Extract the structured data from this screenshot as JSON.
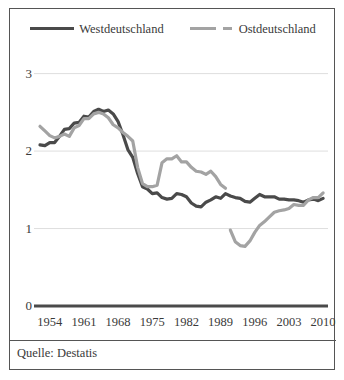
{
  "figure": {
    "source_note": "Quelle: Destatis",
    "border_color": "#555555",
    "background": "#ffffff"
  },
  "legend": {
    "position": "top-center",
    "entries": [
      {
        "label": "Westdeutschland",
        "color": "#4a4a4a",
        "style": "solid",
        "marker": "line-swatch-solid"
      },
      {
        "label": "Ostdeutschland",
        "color": "#a3a3a3",
        "style": "dashed",
        "marker": "line-swatch-dashed"
      }
    ]
  },
  "chart_data": {
    "type": "line",
    "title": "",
    "subtitle": "",
    "xlabel": "",
    "ylabel": "",
    "xlim": [
      1952,
      2011
    ],
    "ylim": [
      0,
      3.15
    ],
    "grid": true,
    "grid_axis": "y",
    "legend_position": "top-center",
    "xticks": [
      1954,
      1961,
      1968,
      1975,
      1982,
      1989,
      1996,
      2003,
      2010
    ],
    "yticks": [
      0,
      1,
      2,
      3
    ],
    "ytick_labels": [
      "0",
      "1",
      "2",
      "3"
    ],
    "xtick_labels": [
      "1954",
      "1961",
      "1968",
      "1975",
      "1982",
      "1989",
      "1996",
      "2003",
      "2010"
    ],
    "series": [
      {
        "name": "Westdeutschland",
        "color": "#4a4a4a",
        "style": "solid",
        "x": [
          1952,
          1953,
          1954,
          1955,
          1956,
          1957,
          1958,
          1959,
          1960,
          1961,
          1962,
          1963,
          1964,
          1965,
          1966,
          1967,
          1968,
          1969,
          1970,
          1971,
          1972,
          1973,
          1974,
          1975,
          1976,
          1977,
          1978,
          1979,
          1980,
          1981,
          1982,
          1983,
          1984,
          1985,
          1986,
          1987,
          1988,
          1989,
          1990,
          1991,
          1992,
          1993,
          1994,
          1995,
          1996,
          1997,
          1998,
          1999,
          2000,
          2001,
          2002,
          2003,
          2004,
          2005,
          2006,
          2007,
          2008,
          2009,
          2010
        ],
        "values": [
          2.08,
          2.07,
          2.11,
          2.11,
          2.19,
          2.28,
          2.29,
          2.36,
          2.37,
          2.45,
          2.44,
          2.51,
          2.54,
          2.51,
          2.53,
          2.48,
          2.38,
          2.21,
          2.02,
          1.92,
          1.71,
          1.54,
          1.51,
          1.45,
          1.46,
          1.4,
          1.38,
          1.39,
          1.45,
          1.44,
          1.41,
          1.33,
          1.29,
          1.28,
          1.34,
          1.37,
          1.41,
          1.39,
          1.45,
          1.42,
          1.4,
          1.39,
          1.35,
          1.34,
          1.39,
          1.44,
          1.41,
          1.41,
          1.41,
          1.38,
          1.38,
          1.37,
          1.37,
          1.36,
          1.34,
          1.37,
          1.38,
          1.36,
          1.39
        ]
      },
      {
        "name": "Ostdeutschland",
        "color": "#a3a3a3",
        "style": "dashed",
        "gap_note": "line break between 1990 and 1991",
        "x": [
          1952,
          1953,
          1954,
          1955,
          1956,
          1957,
          1958,
          1959,
          1960,
          1961,
          1962,
          1963,
          1964,
          1965,
          1966,
          1967,
          1968,
          1969,
          1970,
          1971,
          1972,
          1973,
          1974,
          1975,
          1976,
          1977,
          1978,
          1979,
          1980,
          1981,
          1982,
          1983,
          1984,
          1985,
          1986,
          1987,
          1988,
          1989,
          1990,
          1991,
          1992,
          1993,
          1994,
          1995,
          1996,
          1997,
          1998,
          1999,
          2000,
          2001,
          2002,
          2003,
          2004,
          2005,
          2006,
          2007,
          2008,
          2009,
          2010
        ],
        "values": [
          2.32,
          2.26,
          2.2,
          2.17,
          2.19,
          2.22,
          2.19,
          2.3,
          2.33,
          2.42,
          2.42,
          2.48,
          2.5,
          2.48,
          2.43,
          2.34,
          2.3,
          2.24,
          2.19,
          2.13,
          1.79,
          1.58,
          1.54,
          1.54,
          1.56,
          1.85,
          1.9,
          1.9,
          1.94,
          1.86,
          1.86,
          1.79,
          1.74,
          1.73,
          1.7,
          1.74,
          1.67,
          1.57,
          1.52,
          0.98,
          0.83,
          0.78,
          0.77,
          0.84,
          0.95,
          1.04,
          1.09,
          1.15,
          1.21,
          1.23,
          1.24,
          1.26,
          1.31,
          1.3,
          1.3,
          1.37,
          1.4,
          1.4,
          1.46
        ]
      }
    ]
  }
}
